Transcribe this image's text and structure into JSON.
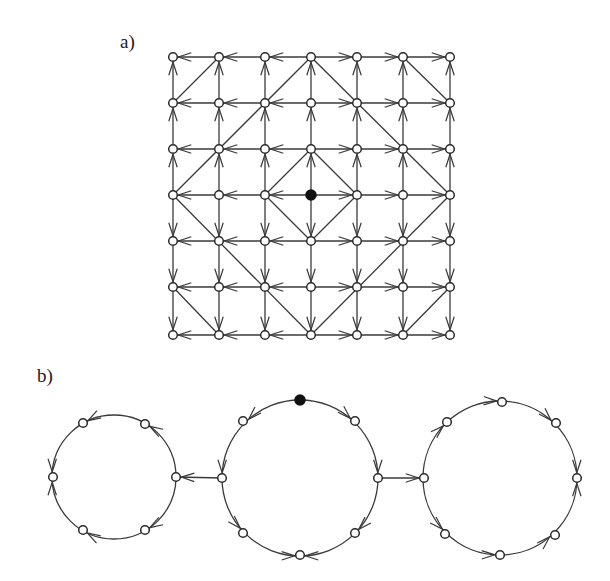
{
  "labels": {
    "a": "a)",
    "b": "b)"
  },
  "colors": {
    "stroke": "#3a3a3a",
    "node_fill": "#ffffff",
    "source_fill": "#111111",
    "background": "#ffffff"
  },
  "panel_a": {
    "description": "7x7 grid graph; arrows point outward from the filled center node; diagonal undirected lines form nested L1-distance contours",
    "grid_size": 7,
    "columns_x": [
      173,
      219,
      265,
      311,
      357,
      403,
      450
    ],
    "rows_y": [
      57,
      103,
      149,
      195,
      241,
      287,
      335
    ],
    "source_node": [
      3,
      3
    ],
    "diagonals": [
      [
        [
          3,
          2
        ],
        [
          4,
          3
        ]
      ],
      [
        [
          4,
          3
        ],
        [
          3,
          4
        ]
      ],
      [
        [
          3,
          4
        ],
        [
          2,
          3
        ]
      ],
      [
        [
          2,
          3
        ],
        [
          3,
          2
        ]
      ],
      [
        [
          3,
          0
        ],
        [
          0,
          3
        ]
      ],
      [
        [
          3,
          0
        ],
        [
          6,
          3
        ]
      ],
      [
        [
          0,
          3
        ],
        [
          3,
          6
        ]
      ],
      [
        [
          6,
          3
        ],
        [
          3,
          6
        ]
      ],
      [
        [
          0,
          1
        ],
        [
          1,
          0
        ]
      ],
      [
        [
          5,
          0
        ],
        [
          6,
          1
        ]
      ],
      [
        [
          0,
          5
        ],
        [
          1,
          6
        ]
      ],
      [
        [
          5,
          6
        ],
        [
          6,
          5
        ]
      ]
    ]
  },
  "panel_b": {
    "description": "three cycles connected by directed edges; filled source node at top of middle cycle",
    "circles": [
      {
        "name": "left-cycle",
        "center": [
          114,
          477
        ],
        "radius": 62,
        "nodes": [
          [
            176,
            477
          ],
          [
            145,
            424
          ],
          [
            83,
            423
          ],
          [
            53,
            477
          ],
          [
            83,
            530
          ],
          [
            145,
            530
          ]
        ],
        "arcs": [
          [
            0,
            1
          ],
          [
            1,
            2
          ],
          [
            2,
            3
          ],
          [
            0,
            5
          ],
          [
            5,
            4
          ],
          [
            4,
            3
          ]
        ]
      },
      {
        "name": "middle-cycle",
        "center": [
          300,
          478
        ],
        "radius": 78,
        "nodes": [
          [
            300,
            400
          ],
          [
            355,
            421
          ],
          [
            378,
            478
          ],
          [
            355,
            533
          ],
          [
            300,
            555
          ],
          [
            243,
            533
          ],
          [
            222,
            478
          ],
          [
            243,
            421
          ]
        ],
        "source_index": 0,
        "arcs": [
          [
            0,
            1
          ],
          [
            1,
            2
          ],
          [
            2,
            3
          ],
          [
            3,
            4
          ],
          [
            0,
            7
          ],
          [
            7,
            6
          ],
          [
            6,
            5
          ],
          [
            5,
            4
          ]
        ]
      },
      {
        "name": "right-cycle",
        "center": [
          500,
          478
        ],
        "radius": 77,
        "nodes": [
          [
            424,
            478
          ],
          [
            447,
            422
          ],
          [
            502,
            402
          ],
          [
            556,
            423
          ],
          [
            577,
            478
          ],
          [
            555,
            535
          ],
          [
            500,
            555
          ],
          [
            445,
            534
          ]
        ],
        "arcs": [
          [
            0,
            1
          ],
          [
            1,
            2
          ],
          [
            2,
            3
          ],
          [
            3,
            4
          ],
          [
            0,
            7
          ],
          [
            7,
            6
          ],
          [
            6,
            5
          ],
          [
            5,
            4
          ]
        ]
      }
    ],
    "bridges": [
      {
        "from": [
          222,
          478
        ],
        "to": [
          176,
          477
        ]
      },
      {
        "from": [
          378,
          478
        ],
        "to": [
          424,
          478
        ]
      }
    ]
  }
}
